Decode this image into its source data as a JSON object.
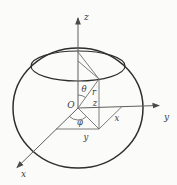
{
  "figure": {
    "type": "spherical-coordinates-diagram",
    "axes": [
      {
        "id": "x",
        "label": "x"
      },
      {
        "id": "y",
        "label": "y"
      },
      {
        "id": "z",
        "label": "z"
      }
    ],
    "origin_label": "O",
    "point_labels": {
      "radius": "r",
      "polar_angle": "θ",
      "azimuth_angle": "φ",
      "coord_x": "x",
      "coord_y": "y",
      "coord_z": "z"
    },
    "colors": {
      "background": "#fbfbfa",
      "outline": "#2e2e2e",
      "axis": "#5f5f5f",
      "construct": "#6d6d6d",
      "label": "#3b3b3b"
    }
  }
}
